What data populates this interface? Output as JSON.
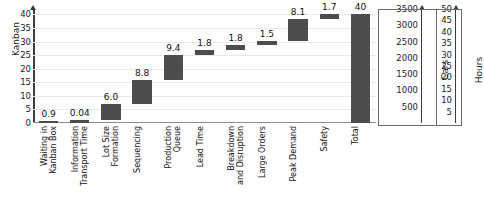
{
  "chart_data": {
    "type": "bar",
    "subtype": "waterfall",
    "title": "",
    "xlabel": "",
    "ylabel": "Kanban",
    "ylim": [
      0,
      42
    ],
    "yticks": [
      0,
      5,
      10,
      15,
      20,
      25,
      30,
      35,
      40
    ],
    "grid": true,
    "legend": null,
    "categories": [
      "Waiting in Kanban Box",
      "Information Transport Time",
      "Lot Size Formation",
      "Sequencing",
      "Production Queue",
      "Lead Time",
      "Breakdown and Disruption",
      "Large Orders",
      "Peak Demand",
      "Safety",
      "Total"
    ],
    "category_lines": [
      [
        "Waiting in",
        "Kanban Box"
      ],
      [
        "Information",
        "Transport Time"
      ],
      [
        "Lot Size",
        "Formation"
      ],
      [
        "Sequencing",
        ""
      ],
      [
        "Production",
        "Queue"
      ],
      [
        "Lead Time",
        ""
      ],
      [
        "Breakdown",
        "and Disruption"
      ],
      [
        "Large Orders",
        ""
      ],
      [
        "Peak Demand",
        ""
      ],
      [
        "Safety",
        ""
      ],
      [
        "Total",
        ""
      ]
    ],
    "values": [
      0.9,
      0.04,
      6.0,
      8.8,
      9.4,
      1.8,
      1.8,
      1.5,
      8.1,
      1.7,
      40
    ],
    "value_labels": [
      "0.9",
      "0.04",
      "6.0",
      "8.8",
      "9.4",
      "1.8",
      "1.8",
      "1.5",
      "8.1",
      "1.7",
      "40"
    ],
    "bar_bases": [
      0,
      0.9,
      0.94,
      6.94,
      15.74,
      25.14,
      26.94,
      28.74,
      30.24,
      38.34,
      0
    ],
    "bar_tops": [
      0.9,
      0.94,
      6.94,
      15.74,
      25.14,
      26.94,
      28.74,
      30.24,
      38.34,
      40.04,
      40
    ],
    "secondary_axes": [
      {
        "name": "Cars",
        "ticks": [
          500,
          1000,
          1500,
          2000,
          2500,
          3000,
          3500
        ],
        "tick_labels": [
          "500",
          "1000",
          "1500",
          "2000",
          "2500",
          "3000",
          "3500"
        ],
        "lim": [
          0,
          3500
        ]
      },
      {
        "name": "Hours",
        "ticks": [
          5,
          10,
          15,
          20,
          25,
          30,
          35,
          40,
          45,
          50
        ],
        "tick_labels": [
          "5",
          "10",
          "15",
          "20",
          "25",
          "30",
          "35",
          "40",
          "45",
          "50"
        ],
        "lim": [
          0,
          50
        ]
      }
    ],
    "colors": {
      "bar": "#4d4d4d",
      "grid": "#e9e9e9",
      "axis": "#3a3a3a",
      "text": "#111111",
      "background": "#ffffff"
    }
  }
}
